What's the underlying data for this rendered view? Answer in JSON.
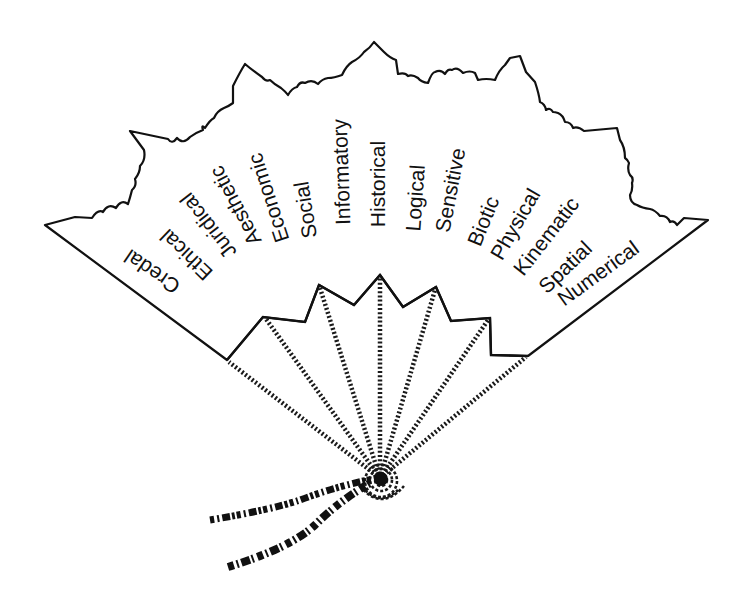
{
  "diagram": {
    "type": "folding-fan",
    "colors": {
      "ink": "#111111",
      "paper": "#ffffff"
    },
    "pivot": {
      "x": 380,
      "y": 478
    },
    "aspects": [
      {
        "label": "Credal",
        "x": 152,
        "y": 272,
        "angle": -146
      },
      {
        "label": "Ethical",
        "x": 186,
        "y": 255,
        "angle": -136
      },
      {
        "label": "Juridical",
        "x": 208,
        "y": 226,
        "angle": -128
      },
      {
        "label": "Aesthetic",
        "x": 235,
        "y": 206,
        "angle": -118
      },
      {
        "label": "Economic",
        "x": 268,
        "y": 198,
        "angle": -108
      },
      {
        "label": "Social",
        "x": 305,
        "y": 210,
        "angle": -99
      },
      {
        "label": "Informatory",
        "x": 341,
        "y": 172,
        "angle": -92
      },
      {
        "label": "Historical",
        "x": 377,
        "y": 184,
        "angle": -90
      },
      {
        "label": "Logical",
        "x": 415,
        "y": 198,
        "angle": -86
      },
      {
        "label": "Sensitive",
        "x": 450,
        "y": 190,
        "angle": -79
      },
      {
        "label": "Biotic",
        "x": 483,
        "y": 221,
        "angle": -68
      },
      {
        "label": "Physical",
        "x": 515,
        "y": 224,
        "angle": -60
      },
      {
        "label": "Kinematic",
        "x": 546,
        "y": 236,
        "angle": -52
      },
      {
        "label": "Spatial",
        "x": 565,
        "y": 267,
        "angle": -44
      },
      {
        "label": "Numerical",
        "x": 598,
        "y": 273,
        "angle": -36
      }
    ]
  }
}
